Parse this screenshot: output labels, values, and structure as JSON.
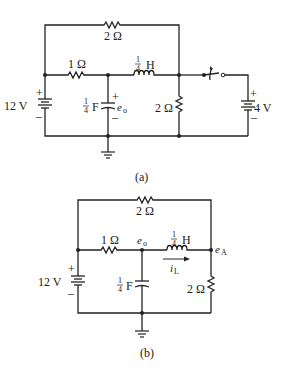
{
  "figure_a": {
    "caption": "(a)",
    "top_resistor": "2 Ω",
    "series_resistor": "1 Ω",
    "inductor": {
      "num": "1",
      "den": "4",
      "unit": "H"
    },
    "capacitor": {
      "num": "1",
      "den": "4",
      "unit": "F",
      "voltage_label": "e",
      "voltage_sub": "o",
      "plus": "+",
      "minus": "–"
    },
    "shunt_resistor": "2 Ω",
    "left_source": {
      "value": "12 V",
      "plus": "+",
      "minus": "–"
    },
    "right_source": {
      "value": "4 V",
      "plus": "+",
      "minus": "–"
    },
    "switch": "switch",
    "ground": "ground"
  },
  "figure_b": {
    "caption": "(b)",
    "top_resistor": "2 Ω",
    "series_resistor": "1 Ω",
    "node_o": {
      "label": "e",
      "sub": "o"
    },
    "node_a": {
      "label": "e",
      "sub": "A"
    },
    "inductor": {
      "num": "1",
      "den": "4",
      "unit": "H"
    },
    "inductor_current": {
      "label": "i",
      "sub": "L"
    },
    "capacitor": {
      "num": "1",
      "den": "4",
      "unit": "F"
    },
    "shunt_resistor": "2 Ω",
    "left_source": {
      "value": "12 V",
      "plus": "+",
      "minus": "–"
    },
    "ground": "ground"
  }
}
